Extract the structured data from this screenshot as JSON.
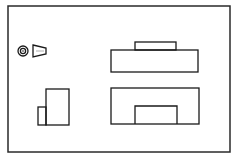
{
  "diagram": {
    "type": "orthographic-projection",
    "projection_symbol": "third-angle-projection-symbol",
    "frame": {
      "x1": 8,
      "y1": 6,
      "x2": 230,
      "y2": 152
    },
    "stroke_color": "#1a1a1a",
    "background_color": "#ffffff",
    "views": [
      {
        "name": "top-view",
        "shapes": [
          {
            "kind": "rect",
            "x": 111,
            "y": 50,
            "w": 87,
            "h": 22
          },
          {
            "kind": "rect",
            "x": 135,
            "y": 42,
            "w": 41,
            "h": 8
          }
        ]
      },
      {
        "name": "front-view",
        "shapes": [
          {
            "kind": "rect",
            "x": 111,
            "y": 88,
            "w": 88,
            "h": 36
          },
          {
            "kind": "rect",
            "x": 135,
            "y": 106,
            "w": 42,
            "h": 18
          }
        ]
      },
      {
        "name": "side-view",
        "shapes": [
          {
            "kind": "rect",
            "x": 46,
            "y": 89,
            "w": 23,
            "h": 36
          },
          {
            "kind": "rect",
            "x": 38,
            "y": 107,
            "w": 8,
            "h": 18
          }
        ]
      }
    ],
    "symbol": {
      "circles": [
        {
          "cx": 23,
          "cy": 51,
          "r": 5
        },
        {
          "cx": 23,
          "cy": 51,
          "r": 2.6
        },
        {
          "cx": 23,
          "cy": 51,
          "r": 0.8
        }
      ],
      "cone": {
        "x_left": 33,
        "y_left_top": 45,
        "y_left_bottom": 57,
        "x_right": 46,
        "y_right_top": 48,
        "y_right_bottom": 54
      }
    },
    "labels": {
      "frame": "Drawing frame",
      "top_view": "Top view",
      "front_view": "Front view",
      "side_view": "Side view",
      "symbol": "Projection symbol"
    }
  }
}
